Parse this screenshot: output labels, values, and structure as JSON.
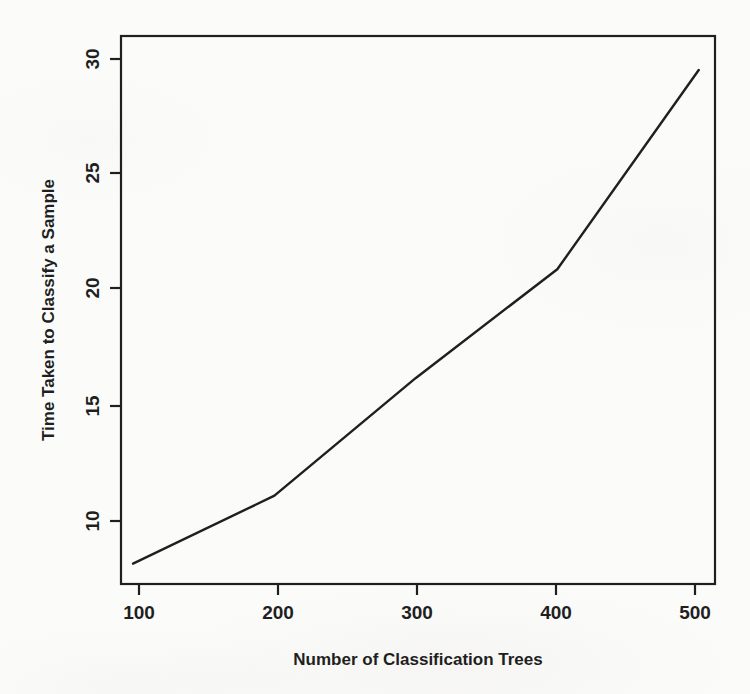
{
  "chart_data": {
    "type": "line",
    "title": "",
    "xlabel": "Number of Classification Trees",
    "ylabel": "Time Taken to Classify a Sample",
    "x": [
      100,
      200,
      300,
      400,
      500
    ],
    "values": [
      8.2,
      11.2,
      16.4,
      21.2,
      30.0
    ],
    "series": [
      {
        "name": "Time Taken to Classify a Sample",
        "x": [
          100,
          200,
          300,
          400,
          500
        ],
        "values": [
          8.2,
          11.2,
          16.4,
          21.2,
          30.0
        ]
      }
    ],
    "xticks": [
      100,
      200,
      300,
      400,
      500
    ],
    "xtick_labels": [
      "100",
      "200",
      "300",
      "400",
      "500"
    ],
    "yticks": [
      10,
      15,
      20,
      25,
      30
    ],
    "ytick_labels": [
      "10",
      "15",
      "20",
      "25",
      "30"
    ],
    "xlim": [
      91.5,
      511.5
    ],
    "ylim": [
      7.3,
      31.5
    ],
    "grid": false,
    "legend": false,
    "legend_position": "none",
    "line_color": "#1f1f1f",
    "background_color": "#fbfbf9",
    "axis_color": "#1f1f1f",
    "box": true
  },
  "axis": {
    "x_title": "Number of Classification Trees",
    "y_title": "Time Taken to Classify a Sample",
    "x_tick_0": "100",
    "x_tick_1": "200",
    "x_tick_2": "300",
    "x_tick_3": "400",
    "x_tick_4": "500",
    "y_tick_0": "10",
    "y_tick_1": "15",
    "y_tick_2": "20",
    "y_tick_3": "25",
    "y_tick_4": "30"
  }
}
